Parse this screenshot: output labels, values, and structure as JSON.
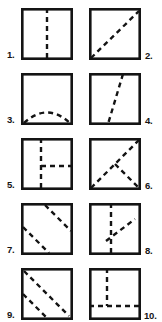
{
  "sheet": {
    "width": 162,
    "height": 322,
    "background_color": "#ffffff",
    "ink_color": "#141414",
    "border_color": "#141414",
    "dash_color": "#141414",
    "border_width": 2.6,
    "dash_width": 2.4,
    "dash_pattern": "5 4",
    "box_size": 52,
    "description": "Ten numbered squares, each drawn with a solid outline and one or more dashed interior fold lines."
  },
  "figures": [
    {
      "number": "1.",
      "label_side": "left",
      "box_x": 21,
      "box_y": 8,
      "label_x": 7,
      "label_y": 50,
      "fold_description": "vertical dashed line down the middle",
      "lines": [
        {
          "type": "line",
          "x1": 26,
          "y1": 0,
          "x2": 26,
          "y2": 52
        }
      ]
    },
    {
      "number": "2.",
      "label_side": "right",
      "box_x": 89,
      "box_y": 8,
      "label_x": 145,
      "label_y": 51,
      "fold_description": "dashed diagonal from bottom-left corner to top-right corner",
      "lines": [
        {
          "type": "line",
          "x1": 2,
          "y1": 50,
          "x2": 50,
          "y2": 3
        }
      ]
    },
    {
      "number": "3.",
      "label_side": "left",
      "box_x": 21,
      "box_y": 73,
      "label_x": 7,
      "label_y": 115,
      "fold_description": "dashed arc curving from bottom-left corner up and over to bottom-right corner",
      "lines": [
        {
          "type": "path",
          "d": "M 3 50 Q 26 29 49 50"
        }
      ]
    },
    {
      "number": "4.",
      "label_side": "right",
      "box_x": 89,
      "box_y": 73,
      "label_x": 145,
      "label_y": 116,
      "fold_description": "steep dashed diagonal from top edge right of centre down to bottom edge left of centre",
      "lines": [
        {
          "type": "line",
          "x1": 34,
          "y1": 1,
          "x2": 19,
          "y2": 51
        }
      ]
    },
    {
      "number": "5.",
      "label_side": "left",
      "box_x": 21,
      "box_y": 138,
      "label_x": 7,
      "label_y": 180,
      "fold_description": "full vertical dashed line plus a horizontal dashed line from the centre to the right edge",
      "lines": [
        {
          "type": "line",
          "x1": 20,
          "y1": 0,
          "x2": 20,
          "y2": 52
        },
        {
          "type": "line",
          "x1": 20,
          "y1": 28,
          "x2": 52,
          "y2": 28
        }
      ]
    },
    {
      "number": "6.",
      "label_side": "right",
      "box_x": 89,
      "box_y": 138,
      "label_x": 145,
      "label_y": 181,
      "fold_description": "dashed diagonal from bottom-left to top-right corner plus a short dashed diagonal from the centre to the bottom-right corner",
      "lines": [
        {
          "type": "line",
          "x1": 2,
          "y1": 50,
          "x2": 50,
          "y2": 2
        },
        {
          "type": "line",
          "x1": 26,
          "y1": 26,
          "x2": 50,
          "y2": 50
        }
      ]
    },
    {
      "number": "7.",
      "label_side": "left",
      "box_x": 21,
      "box_y": 203,
      "label_x": 7,
      "label_y": 245,
      "fold_description": "two parallel dashed diagonals sloping down to the right",
      "lines": [
        {
          "type": "line",
          "x1": 24,
          "y1": 2,
          "x2": 50,
          "y2": 28
        },
        {
          "type": "line",
          "x1": 2,
          "y1": 24,
          "x2": 28,
          "y2": 50
        }
      ]
    },
    {
      "number": "8.",
      "label_side": "right",
      "box_x": 89,
      "box_y": 203,
      "label_x": 145,
      "label_y": 246,
      "fold_description": "vertical dashed line just left of centre plus a dashed diagonal rising to the right",
      "lines": [
        {
          "type": "line",
          "x1": 22,
          "y1": 0,
          "x2": 22,
          "y2": 52
        },
        {
          "type": "line",
          "x1": 17,
          "y1": 38,
          "x2": 46,
          "y2": 16
        }
      ]
    },
    {
      "number": "9.",
      "label_side": "left",
      "box_x": 21,
      "box_y": 268,
      "label_x": 7,
      "label_y": 310,
      "fold_description": "two parallel dashed diagonals from the upper-left sloping down to the lower-right",
      "lines": [
        {
          "type": "line",
          "x1": 3,
          "y1": 3,
          "x2": 48,
          "y2": 48
        },
        {
          "type": "line",
          "x1": 2,
          "y1": 26,
          "x2": 26,
          "y2": 50
        }
      ]
    },
    {
      "number": "10.",
      "label_side": "right",
      "box_x": 89,
      "box_y": 268,
      "label_x": 144,
      "label_y": 311,
      "fold_description": "vertical dashed line from the top edge down to a horizontal dashed line that crosses the full width",
      "lines": [
        {
          "type": "line",
          "x1": 18,
          "y1": 0,
          "x2": 18,
          "y2": 38
        },
        {
          "type": "line",
          "x1": 0,
          "y1": 38,
          "x2": 52,
          "y2": 38
        }
      ]
    }
  ]
}
